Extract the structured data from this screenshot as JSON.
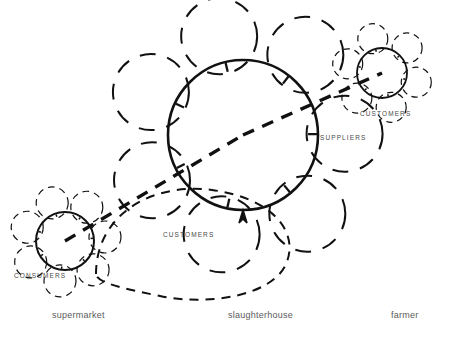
{
  "figure": {
    "type": "network-diagram",
    "background_color": "#ffffff",
    "stroke_color": "#111111",
    "label_color": "#5a5a5a",
    "role_label_color": "#4a4a4a"
  },
  "nodes": [
    {
      "id": "supermarket",
      "label": "supermarket",
      "label_x": 52,
      "label_y": 310,
      "core": {
        "cx": 65,
        "cy": 241,
        "r": 29,
        "style": "solid"
      },
      "petal_r": 16,
      "petal_count": 7,
      "petal_start_deg": 200
    },
    {
      "id": "slaughterhouse",
      "label": "slaughterhouse",
      "label_x": 228,
      "label_y": 310,
      "core": {
        "cx": 243,
        "cy": 135,
        "r": 75,
        "style": "solid"
      },
      "petal_r": 38,
      "petal_count": 7,
      "petal_start_deg": 205
    },
    {
      "id": "farmer",
      "label": "farmer",
      "label_x": 391,
      "label_y": 310,
      "core": {
        "cx": 382,
        "cy": 73,
        "r": 25,
        "style": "solid"
      },
      "petal_r": 15,
      "petal_count": 6,
      "petal_start_deg": 195
    }
  ],
  "role_labels": [
    {
      "id": "consumers-left",
      "text": "CONSUMERS",
      "x": 14,
      "y": 272
    },
    {
      "id": "customers-center",
      "text": "CUSTOMERS",
      "x": 163,
      "y": 231
    },
    {
      "id": "suppliers-center",
      "text": "SUPPLIERS",
      "x": 320,
      "y": 134
    },
    {
      "id": "customers-right",
      "text": "CUSTOMERS",
      "x": 360,
      "y": 110
    }
  ],
  "links": [
    {
      "id": "supermarket-to-slaughterhouse",
      "from": "supermarket",
      "to": "slaughterhouse",
      "style": "thick-dashed",
      "width": 3.4
    },
    {
      "id": "slaughterhouse-to-farmer",
      "from": "slaughterhouse",
      "to": "farmer",
      "style": "thick-dashed",
      "width": 3.4
    }
  ]
}
